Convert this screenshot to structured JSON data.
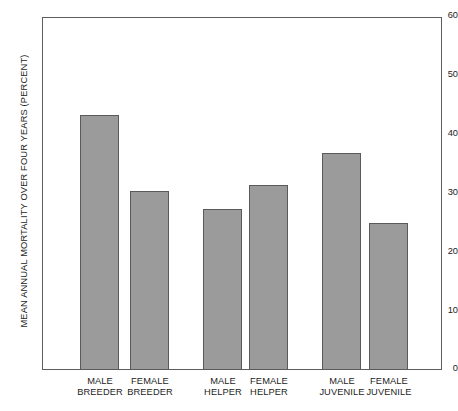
{
  "chart_data": {
    "type": "bar",
    "title": "",
    "subtitle": "",
    "xlabel": "",
    "ylabel": "MEAN ANNUAL MORTALITY OVER FOUR YEARS (PERCENT)",
    "ylim": [
      0,
      60
    ],
    "yticks": [
      0,
      10,
      20,
      30,
      40,
      50,
      60
    ],
    "ytick_labels": [
      "0",
      "10",
      "20",
      "30",
      "40",
      "50",
      "60"
    ],
    "grid": false,
    "legend": null,
    "categories": [
      "MALE\nBREEDER",
      "FEMALE\nBREEDER",
      "MALE\nHELPER",
      "FEMALE\nHELPER",
      "MALE\nJUVENILE",
      "FEMALE\nJUVENILE"
    ],
    "values": [
      43.3,
      30.4,
      27.3,
      31.4,
      36.8,
      25.0
    ],
    "bar_color": "#9b9b9b",
    "bar_edge_color": "#5a5a5a",
    "axis_color": "#5d5d5d",
    "background_color": "#ffffff"
  }
}
